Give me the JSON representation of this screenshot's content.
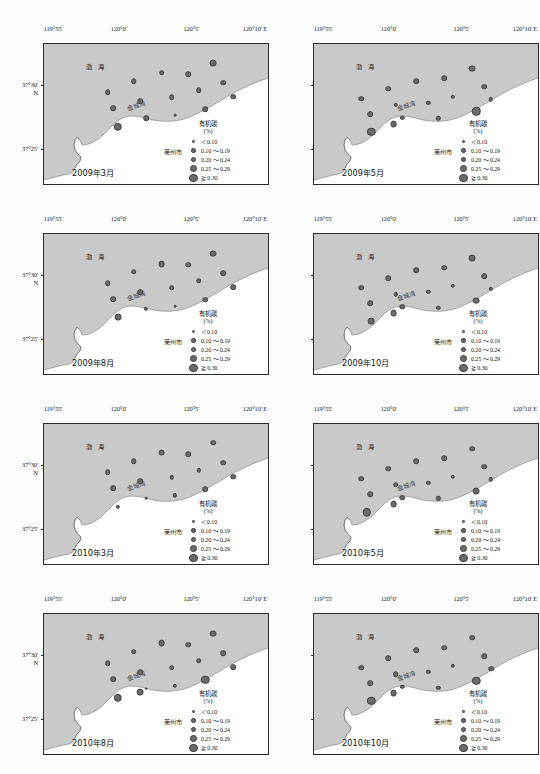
{
  "figure": {
    "colors": {
      "sea": "#c9c9c9",
      "land": "#ffffff",
      "point_fill": "#6b6b6b",
      "point_stroke": "#3d3d3d",
      "frame": "#2a2a2a"
    }
  },
  "axes": {
    "x_label_suffix": "E",
    "x_ticks": [
      {
        "label": "119°55'",
        "pos": 0.0
      },
      {
        "label": "120°0'",
        "pos": 0.3333
      },
      {
        "label": "120°5'",
        "pos": 0.6667
      },
      {
        "label": "120°10' E",
        "pos": 1.0
      }
    ],
    "y_ticks": [
      {
        "label": "37°30'",
        "sub": "N",
        "pos": 0.3
      },
      {
        "label": "37°25'",
        "sub": "",
        "pos": 0.755
      }
    ]
  },
  "map_labels": {
    "sea": "渤 海",
    "bay": "金城湾",
    "city": "莱州市"
  },
  "legend": {
    "title": "有机碳",
    "unit": "(%)",
    "classes": [
      {
        "label": "＜0.10",
        "size": 2.6
      },
      {
        "label": "0.10 ～ 0.19",
        "size": 4.4
      },
      {
        "label": "0.20 ～ 0.24",
        "size": 5.6
      },
      {
        "label": "0.25 ～ 0.29",
        "size": 6.8
      },
      {
        "label": "≧ 0.30",
        "size": 8.4
      }
    ]
  },
  "panels": [
    {
      "id": "panel-2009-03",
      "date": "2009年3月",
      "points": [
        {
          "x": 0.285,
          "y": 0.345,
          "cls": 3
        },
        {
          "x": 0.4,
          "y": 0.265,
          "cls": 3
        },
        {
          "x": 0.525,
          "y": 0.205,
          "cls": 3
        },
        {
          "x": 0.645,
          "y": 0.215,
          "cls": 3
        },
        {
          "x": 0.755,
          "y": 0.135,
          "cls": 4
        },
        {
          "x": 0.8,
          "y": 0.275,
          "cls": 3
        },
        {
          "x": 0.69,
          "y": 0.33,
          "cls": 3
        },
        {
          "x": 0.57,
          "y": 0.38,
          "cls": 3
        },
        {
          "x": 0.845,
          "y": 0.375,
          "cls": 3
        },
        {
          "x": 0.43,
          "y": 0.41,
          "cls": 3
        },
        {
          "x": 0.31,
          "y": 0.46,
          "cls": 3
        },
        {
          "x": 0.455,
          "y": 0.53,
          "cls": 3
        },
        {
          "x": 0.585,
          "y": 0.51,
          "cls": 1
        },
        {
          "x": 0.72,
          "y": 0.465,
          "cls": 3
        },
        {
          "x": 0.33,
          "y": 0.59,
          "cls": 5
        }
      ]
    },
    {
      "id": "panel-2009-05",
      "date": "2009年5月",
      "points": [
        {
          "x": 0.21,
          "y": 0.39,
          "cls": 3
        },
        {
          "x": 0.33,
          "y": 0.32,
          "cls": 3
        },
        {
          "x": 0.455,
          "y": 0.265,
          "cls": 3
        },
        {
          "x": 0.58,
          "y": 0.245,
          "cls": 3
        },
        {
          "x": 0.705,
          "y": 0.175,
          "cls": 4
        },
        {
          "x": 0.76,
          "y": 0.305,
          "cls": 3
        },
        {
          "x": 0.62,
          "y": 0.375,
          "cls": 2
        },
        {
          "x": 0.51,
          "y": 0.42,
          "cls": 2
        },
        {
          "x": 0.79,
          "y": 0.395,
          "cls": 2
        },
        {
          "x": 0.365,
          "y": 0.435,
          "cls": 2
        },
        {
          "x": 0.25,
          "y": 0.5,
          "cls": 3
        },
        {
          "x": 0.395,
          "y": 0.525,
          "cls": 2
        },
        {
          "x": 0.555,
          "y": 0.53,
          "cls": 2
        },
        {
          "x": 0.725,
          "y": 0.48,
          "cls": 5
        },
        {
          "x": 0.355,
          "y": 0.57,
          "cls": 4
        },
        {
          "x": 0.255,
          "y": 0.625,
          "cls": 5
        }
      ]
    },
    {
      "id": "panel-2009-08",
      "date": "2009年8月",
      "points": [
        {
          "x": 0.285,
          "y": 0.35,
          "cls": 3
        },
        {
          "x": 0.4,
          "y": 0.27,
          "cls": 3
        },
        {
          "x": 0.525,
          "y": 0.215,
          "cls": 4
        },
        {
          "x": 0.645,
          "y": 0.22,
          "cls": 3
        },
        {
          "x": 0.755,
          "y": 0.14,
          "cls": 4
        },
        {
          "x": 0.8,
          "y": 0.28,
          "cls": 3
        },
        {
          "x": 0.69,
          "y": 0.335,
          "cls": 3
        },
        {
          "x": 0.57,
          "y": 0.385,
          "cls": 3
        },
        {
          "x": 0.845,
          "y": 0.38,
          "cls": 3
        },
        {
          "x": 0.43,
          "y": 0.415,
          "cls": 3
        },
        {
          "x": 0.31,
          "y": 0.465,
          "cls": 3
        },
        {
          "x": 0.455,
          "y": 0.535,
          "cls": 2
        },
        {
          "x": 0.585,
          "y": 0.515,
          "cls": 1
        },
        {
          "x": 0.72,
          "y": 0.47,
          "cls": 3
        },
        {
          "x": 0.33,
          "y": 0.595,
          "cls": 4
        }
      ]
    },
    {
      "id": "panel-2009-10",
      "date": "2009年10月",
      "points": [
        {
          "x": 0.21,
          "y": 0.385,
          "cls": 3
        },
        {
          "x": 0.33,
          "y": 0.315,
          "cls": 3
        },
        {
          "x": 0.455,
          "y": 0.26,
          "cls": 3
        },
        {
          "x": 0.58,
          "y": 0.24,
          "cls": 3
        },
        {
          "x": 0.705,
          "y": 0.17,
          "cls": 4
        },
        {
          "x": 0.76,
          "y": 0.3,
          "cls": 3
        },
        {
          "x": 0.62,
          "y": 0.37,
          "cls": 2
        },
        {
          "x": 0.51,
          "y": 0.415,
          "cls": 2
        },
        {
          "x": 0.79,
          "y": 0.39,
          "cls": 2
        },
        {
          "x": 0.365,
          "y": 0.43,
          "cls": 2
        },
        {
          "x": 0.25,
          "y": 0.495,
          "cls": 3
        },
        {
          "x": 0.395,
          "y": 0.52,
          "cls": 3
        },
        {
          "x": 0.555,
          "y": 0.525,
          "cls": 2
        },
        {
          "x": 0.725,
          "y": 0.475,
          "cls": 4
        },
        {
          "x": 0.355,
          "y": 0.565,
          "cls": 4
        },
        {
          "x": 0.255,
          "y": 0.62,
          "cls": 4
        }
      ]
    },
    {
      "id": "panel-2010-03",
      "date": "2010年3月",
      "points": [
        {
          "x": 0.285,
          "y": 0.345,
          "cls": 3
        },
        {
          "x": 0.4,
          "y": 0.265,
          "cls": 3
        },
        {
          "x": 0.525,
          "y": 0.205,
          "cls": 4
        },
        {
          "x": 0.645,
          "y": 0.215,
          "cls": 3
        },
        {
          "x": 0.755,
          "y": 0.135,
          "cls": 3
        },
        {
          "x": 0.8,
          "y": 0.275,
          "cls": 3
        },
        {
          "x": 0.69,
          "y": 0.33,
          "cls": 2
        },
        {
          "x": 0.57,
          "y": 0.38,
          "cls": 2
        },
        {
          "x": 0.845,
          "y": 0.375,
          "cls": 3
        },
        {
          "x": 0.43,
          "y": 0.41,
          "cls": 3
        },
        {
          "x": 0.31,
          "y": 0.46,
          "cls": 3
        },
        {
          "x": 0.455,
          "y": 0.53,
          "cls": 1
        },
        {
          "x": 0.585,
          "y": 0.51,
          "cls": 2
        },
        {
          "x": 0.72,
          "y": 0.465,
          "cls": 3
        },
        {
          "x": 0.33,
          "y": 0.59,
          "cls": 2
        }
      ]
    },
    {
      "id": "panel-2010-05",
      "date": "2010年5月",
      "points": [
        {
          "x": 0.21,
          "y": 0.39,
          "cls": 3
        },
        {
          "x": 0.33,
          "y": 0.32,
          "cls": 3
        },
        {
          "x": 0.455,
          "y": 0.265,
          "cls": 3
        },
        {
          "x": 0.58,
          "y": 0.245,
          "cls": 3
        },
        {
          "x": 0.705,
          "y": 0.175,
          "cls": 3
        },
        {
          "x": 0.76,
          "y": 0.305,
          "cls": 3
        },
        {
          "x": 0.62,
          "y": 0.375,
          "cls": 2
        },
        {
          "x": 0.51,
          "y": 0.42,
          "cls": 2
        },
        {
          "x": 0.79,
          "y": 0.395,
          "cls": 2
        },
        {
          "x": 0.365,
          "y": 0.435,
          "cls": 3
        },
        {
          "x": 0.25,
          "y": 0.5,
          "cls": 3
        },
        {
          "x": 0.395,
          "y": 0.525,
          "cls": 3
        },
        {
          "x": 0.555,
          "y": 0.53,
          "cls": 2
        },
        {
          "x": 0.725,
          "y": 0.48,
          "cls": 4
        },
        {
          "x": 0.355,
          "y": 0.57,
          "cls": 4
        },
        {
          "x": 0.235,
          "y": 0.63,
          "cls": 5
        }
      ]
    },
    {
      "id": "panel-2010-08",
      "date": "2010年8月",
      "points": [
        {
          "x": 0.285,
          "y": 0.35,
          "cls": 3
        },
        {
          "x": 0.4,
          "y": 0.27,
          "cls": 3
        },
        {
          "x": 0.525,
          "y": 0.21,
          "cls": 4
        },
        {
          "x": 0.645,
          "y": 0.22,
          "cls": 3
        },
        {
          "x": 0.755,
          "y": 0.14,
          "cls": 4
        },
        {
          "x": 0.8,
          "y": 0.28,
          "cls": 3
        },
        {
          "x": 0.69,
          "y": 0.335,
          "cls": 3
        },
        {
          "x": 0.57,
          "y": 0.385,
          "cls": 3
        },
        {
          "x": 0.845,
          "y": 0.38,
          "cls": 3
        },
        {
          "x": 0.43,
          "y": 0.415,
          "cls": 3
        },
        {
          "x": 0.31,
          "y": 0.465,
          "cls": 3
        },
        {
          "x": 0.455,
          "y": 0.535,
          "cls": 1
        },
        {
          "x": 0.585,
          "y": 0.515,
          "cls": 2
        },
        {
          "x": 0.72,
          "y": 0.47,
          "cls": 5
        },
        {
          "x": 0.43,
          "y": 0.56,
          "cls": 4
        },
        {
          "x": 0.33,
          "y": 0.6,
          "cls": 5
        }
      ]
    },
    {
      "id": "panel-2010-10",
      "date": "2010年10月",
      "points": [
        {
          "x": 0.21,
          "y": 0.385,
          "cls": 3
        },
        {
          "x": 0.33,
          "y": 0.315,
          "cls": 3
        },
        {
          "x": 0.455,
          "y": 0.26,
          "cls": 3
        },
        {
          "x": 0.58,
          "y": 0.24,
          "cls": 3
        },
        {
          "x": 0.705,
          "y": 0.17,
          "cls": 3
        },
        {
          "x": 0.76,
          "y": 0.3,
          "cls": 3
        },
        {
          "x": 0.62,
          "y": 0.37,
          "cls": 2
        },
        {
          "x": 0.51,
          "y": 0.415,
          "cls": 2
        },
        {
          "x": 0.79,
          "y": 0.39,
          "cls": 3
        },
        {
          "x": 0.365,
          "y": 0.43,
          "cls": 3
        },
        {
          "x": 0.25,
          "y": 0.495,
          "cls": 3
        },
        {
          "x": 0.395,
          "y": 0.52,
          "cls": 2
        },
        {
          "x": 0.555,
          "y": 0.525,
          "cls": 2
        },
        {
          "x": 0.725,
          "y": 0.475,
          "cls": 5
        },
        {
          "x": 0.355,
          "y": 0.565,
          "cls": 4
        },
        {
          "x": 0.255,
          "y": 0.62,
          "cls": 5
        }
      ]
    }
  ],
  "chart_data": {
    "type": "scatter",
    "xlabel": "Longitude (E)",
    "ylabel": "Latitude (N)",
    "xlim": [
      "119°55'",
      "120°10'"
    ],
    "ylim": [
      "37°22'",
      "37°33'"
    ],
    "grid": false,
    "legend_position": "inside-right",
    "size_classes": [
      {
        "class": 1,
        "label": "＜0.10",
        "value_range": [
          0.0,
          0.099
        ]
      },
      {
        "class": 2,
        "label": "0.10 ～ 0.19",
        "value_range": [
          0.1,
          0.19
        ]
      },
      {
        "class": 3,
        "label": "0.20 ～ 0.24",
        "value_range": [
          0.2,
          0.24
        ]
      },
      {
        "class": 4,
        "label": "0.25 ～ 0.29",
        "value_range": [
          0.25,
          0.29
        ]
      },
      {
        "class": 5,
        "label": "≧ 0.30",
        "value_range": [
          0.3,
          1.0
        ]
      }
    ],
    "panel_labels": [
      "2009年3月",
      "2009年5月",
      "2009年8月",
      "2009年10月",
      "2010年3月",
      "2010年5月",
      "2010年8月",
      "2010年10月"
    ]
  }
}
